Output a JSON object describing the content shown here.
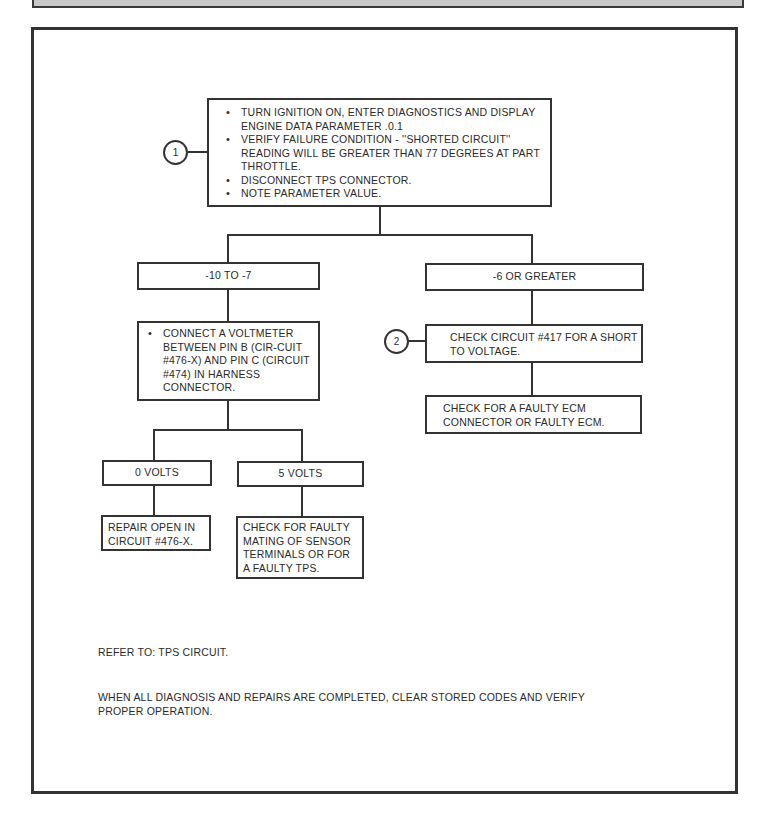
{
  "diagram": {
    "step1": {
      "marker": "1",
      "bullets": [
        "TURN IGNITION ON, ENTER DIAGNOSTICS AND DISPLAY ENGINE DATA PARAMETER .0.1",
        "VERIFY FAILURE CONDITION - ''SHORTED CIRCUIT'' READING WILL BE GREATER THAN 77 DEGREES AT PART THROTTLE.",
        "DISCONNECT TPS CONNECTOR.",
        "NOTE PARAMETER VALUE."
      ]
    },
    "branch_left": {
      "label": "-10 TO -7",
      "action": {
        "bullets": [
          "CONNECT A VOLTMETER BETWEEN PIN B (CIR-CUIT #476-X) AND PIN C (CIRCUIT #474) IN HARNESS CONNECTOR."
        ]
      },
      "sub_left": {
        "label": "0 VOLTS",
        "action": "REPAIR OPEN IN CIRCUIT #476-X."
      },
      "sub_right": {
        "label": "5 VOLTS",
        "action": "CHECK FOR FAULTY MATING OF SENSOR TERMINALS OR FOR A FAULTY TPS."
      }
    },
    "branch_right": {
      "label": "-6 OR GREATER",
      "step2": {
        "marker": "2",
        "action": "CHECK CIRCUIT #417 FOR A SHORT TO VOLTAGE."
      },
      "next_action": "CHECK FOR A FAULTY ECM CONNECTOR OR FAULTY ECM."
    }
  },
  "notes": {
    "refer_to": "REFER TO: TPS CIRCUIT.",
    "completion": "WHEN ALL DIAGNOSIS AND REPAIRS ARE COMPLETED, CLEAR STORED CODES AND VERIFY PROPER OPERATION."
  }
}
